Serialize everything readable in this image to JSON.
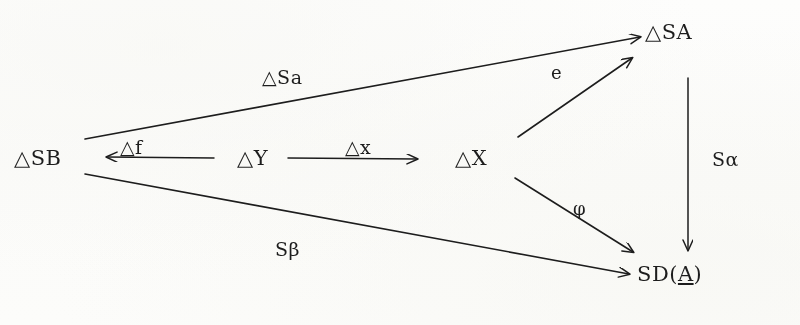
{
  "diagram": {
    "background_color": "#fcfcfb",
    "ink_color": "#1d1d1d",
    "nodes": [
      {
        "id": "dSB",
        "label": "△SB",
        "x": 14,
        "y": 146
      },
      {
        "id": "dY",
        "label": "△Y",
        "x": 237,
        "y": 146
      },
      {
        "id": "dX",
        "label": "△X",
        "x": 455,
        "y": 146
      },
      {
        "id": "dSA",
        "label": "△SA",
        "x": 645,
        "y": 20
      },
      {
        "id": "sdA_pre",
        "label": "SD(",
        "x": 0,
        "y": 0
      },
      {
        "id": "sdA_arg",
        "label": "A",
        "x": 0,
        "y": 0
      },
      {
        "id": "sdA_post",
        "label": ")",
        "x": 0,
        "y": 0
      }
    ],
    "node_sdA": {
      "prefix": "SD(",
      "argument": "A",
      "suffix": ")",
      "x": 637,
      "y": 262
    },
    "edges": [
      {
        "id": "e-df",
        "label": "△f",
        "from": "dY",
        "to": "dSB",
        "label_x": 120,
        "label_y": 136
      },
      {
        "id": "e-dx",
        "label": "△x",
        "from": "dY",
        "to": "dX",
        "label_x": 345,
        "label_y": 136
      },
      {
        "id": "e-dSa",
        "label": "△Sa",
        "from": "dSB",
        "to": "dSA",
        "label_x": 262,
        "label_y": 66
      },
      {
        "id": "e-e",
        "label": "e",
        "from": "dX",
        "to": "dSA",
        "label_x": 551,
        "label_y": 62
      },
      {
        "id": "e-phi",
        "label": "φ",
        "from": "dX",
        "to": "sdA",
        "label_x": 573,
        "label_y": 198
      },
      {
        "id": "e-Sbeta",
        "label": "Sβ",
        "from": "dSB",
        "to": "sdA",
        "label_x": 275,
        "label_y": 238
      },
      {
        "id": "e-Salpha",
        "label": "Sα",
        "from": "dSA",
        "to": "sdA",
        "label_x": 712,
        "label_y": 148
      }
    ]
  }
}
